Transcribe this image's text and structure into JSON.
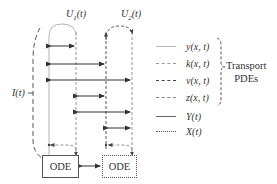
{
  "diagram": {
    "inputs": [
      {
        "id": "U1",
        "label_main": "U",
        "label_sub": "1",
        "label_arg": "(t)"
      },
      {
        "id": "U2",
        "label_main": "U",
        "label_sub": "2",
        "label_arg": "(t)"
      }
    ],
    "output_label": "I(t)",
    "ode_blocks": [
      {
        "id": "ode-left",
        "label": "ODE",
        "border": "solid"
      },
      {
        "id": "ode-right",
        "label": "ODE",
        "border": "dotted"
      }
    ],
    "legend": {
      "items": [
        {
          "style": "solid",
          "label": "y(x, t)",
          "group": "transport"
        },
        {
          "style": "dashed",
          "label": "k(x, t)",
          "group": "transport"
        },
        {
          "style": "dashed",
          "label": "v(x, t)",
          "group": "transport"
        },
        {
          "style": "dashed",
          "label": "z(x, t)",
          "group": "transport"
        },
        {
          "style": "solid",
          "label": "Y(t)",
          "group": "ode"
        },
        {
          "style": "dotted",
          "label": "X(t)",
          "group": "ode"
        }
      ],
      "brace_label_line1": "Transport",
      "brace_label_line2": "PDEs"
    },
    "colors": {
      "line": "#555555",
      "light_line": "#999999"
    }
  }
}
